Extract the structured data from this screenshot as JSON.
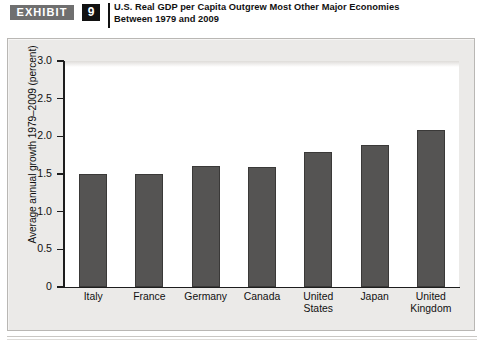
{
  "header": {
    "exhibit_label": "EXHIBIT",
    "exhibit_number": "9",
    "title_line1": "U.S. Real GDP per Capita Outgrew Most Other Major Economies",
    "title_line2": "Between 1979 and 2009"
  },
  "chart_data": {
    "type": "bar",
    "title": "U.S. Real GDP per Capita Outgrew Most Other Major Economies Between 1979 and 2009",
    "xlabel": "",
    "ylabel": "Average annual growth 1979–2009 (percent)",
    "categories": [
      "Italy",
      "France",
      "Germany",
      "Canada",
      "United States",
      "Japan",
      "United Kingdom"
    ],
    "category_lines": [
      [
        "Italy"
      ],
      [
        "France"
      ],
      [
        "Germany"
      ],
      [
        "Canada"
      ],
      [
        "United",
        "States"
      ],
      [
        "Japan"
      ],
      [
        "United",
        "Kingdom"
      ]
    ],
    "values": [
      1.5,
      1.5,
      1.6,
      1.59,
      1.79,
      1.89,
      2.09
    ],
    "ylim": [
      0,
      3.0
    ],
    "ytick_values": [
      0,
      0.5,
      1.0,
      1.5,
      2.0,
      2.5,
      3.0
    ],
    "ytick_labels": [
      "0",
      "0.5",
      "1.0",
      "1.5",
      "2.0",
      "2.5",
      "3.0"
    ],
    "grid": false,
    "legend": null,
    "bar_color": "#555453",
    "bar_edge_color": "#3a3938",
    "plot_background": "#ffffff",
    "panel_background": "#ebeae8"
  }
}
